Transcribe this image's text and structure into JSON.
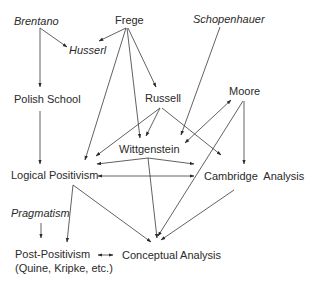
{
  "nodes": {
    "brentano": {
      "label": "Brentano",
      "italic": true
    },
    "frege": {
      "label": "Frege",
      "italic": false
    },
    "schopenhauer": {
      "label": "Schopenhauer",
      "italic": true
    },
    "husserl": {
      "label": "Husserl",
      "italic": true
    },
    "polish_school": {
      "label": "Polish School",
      "italic": false
    },
    "russell": {
      "label": "Russell",
      "italic": false
    },
    "moore": {
      "label": "Moore",
      "italic": false
    },
    "wittgenstein": {
      "label": "Wittgenstein",
      "italic": false
    },
    "logical_positivism": {
      "label": "Logical Positivism",
      "italic": false
    },
    "cambridge_analysis": {
      "label": "Cambridge  Analysis",
      "italic": false
    },
    "pragmatism": {
      "label": "Pragmatism",
      "italic": true
    },
    "post_positivism": {
      "label": "Post-Positivism",
      "sublabel": "(Quine, Kripke, etc.)",
      "italic": false
    },
    "conceptual_analysis": {
      "label": "Conceptual Analysis",
      "italic": false
    }
  },
  "edges": [
    {
      "from": "Brentano",
      "to": "Husserl"
    },
    {
      "from": "Brentano",
      "to": "Polish School"
    },
    {
      "from": "Frege",
      "to": "Husserl"
    },
    {
      "from": "Frege",
      "to": "Russell"
    },
    {
      "from": "Frege",
      "to": "Wittgenstein"
    },
    {
      "from": "Frege",
      "to": "Logical Positivism"
    },
    {
      "from": "Schopenhauer",
      "to": "Wittgenstein"
    },
    {
      "from": "Polish School",
      "to": "Logical Positivism"
    },
    {
      "from": "Russell",
      "to": "Wittgenstein"
    },
    {
      "from": "Russell",
      "to": "Logical Positivism"
    },
    {
      "from": "Russell",
      "to": "Cambridge Analysis"
    },
    {
      "from": "Moore",
      "to": "Wittgenstein",
      "bidirectional": true
    },
    {
      "from": "Moore",
      "to": "Cambridge Analysis"
    },
    {
      "from": "Moore",
      "to": "Conceptual Analysis"
    },
    {
      "from": "Wittgenstein",
      "to": "Logical Positivism"
    },
    {
      "from": "Wittgenstein",
      "to": "Cambridge Analysis"
    },
    {
      "from": "Wittgenstein",
      "to": "Conceptual Analysis"
    },
    {
      "from": "Logical Positivism",
      "to": "Cambridge Analysis",
      "bidirectional": true
    },
    {
      "from": "Logical Positivism",
      "to": "Post-Positivism"
    },
    {
      "from": "Logical Positivism",
      "to": "Conceptual Analysis"
    },
    {
      "from": "Cambridge Analysis",
      "to": "Conceptual Analysis"
    },
    {
      "from": "Pragmatism",
      "to": "Post-Positivism"
    },
    {
      "from": "Post-Positivism",
      "to": "Conceptual Analysis",
      "bidirectional": true
    }
  ]
}
